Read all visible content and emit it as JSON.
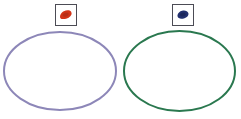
{
  "activity": {
    "description_name": "two-set-sorting-diagram",
    "groups": [
      {
        "position": "left",
        "token": {
          "icon": "red-blob-icon",
          "color": "#d23418",
          "shade_color": "#a02a16"
        },
        "oval": {
          "color": "#8d87b8"
        }
      },
      {
        "position": "right",
        "token": {
          "icon": "blue-blob-icon",
          "color": "#22306e",
          "shade_color": "#17224f"
        },
        "oval": {
          "color": "#2a784f"
        }
      }
    ],
    "token_box": {
      "border_color": "#4c4c55",
      "background": "#ffffff"
    },
    "canvas_background": "#ffffff"
  }
}
